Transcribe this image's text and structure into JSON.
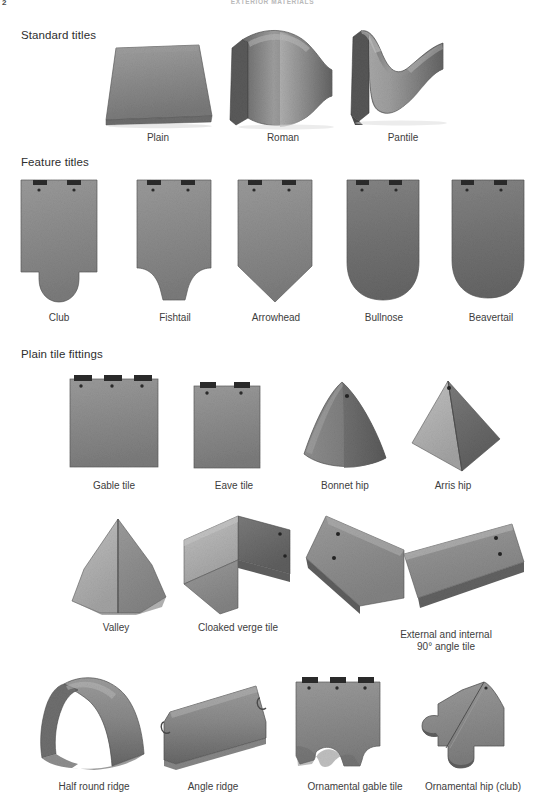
{
  "page": {
    "folio": "2",
    "running_head": "Exterior materials",
    "background": "#ffffff",
    "text_color": "#3a3a3a"
  },
  "palette": {
    "tile_light": "#b4b4b4",
    "tile_mid": "#8f8f8f",
    "tile_dark": "#6e6e6e",
    "tile_darkest": "#4f4f4f",
    "tile_edge": "#3c3c3c",
    "nib_dark": "#2f2f2f",
    "shadow": "#c9c9c9"
  },
  "sections": [
    {
      "id": "standard-tiles",
      "heading": "Standard titles",
      "items": [
        {
          "id": "plain",
          "caption": "Plain",
          "shape": "flat-slab"
        },
        {
          "id": "roman",
          "caption": "Roman",
          "shape": "barrel-roll"
        },
        {
          "id": "pantile",
          "caption": "Pantile",
          "shape": "s-wave"
        }
      ]
    },
    {
      "id": "feature-tiles",
      "heading": "Feature titles",
      "items": [
        {
          "id": "club",
          "caption": "Club",
          "shape": "club-bottom"
        },
        {
          "id": "fishtail",
          "caption": "Fishtail",
          "shape": "fishtail-bottom"
        },
        {
          "id": "arrowhead",
          "caption": "Arrowhead",
          "shape": "pointed-bottom"
        },
        {
          "id": "bullnose",
          "caption": "Bullnose",
          "shape": "round-bottom"
        },
        {
          "id": "beavertail",
          "caption": "Beavertail",
          "shape": "beavertail-bottom"
        }
      ]
    },
    {
      "id": "plain-tile-fittings",
      "heading": "Plain tile fittings",
      "rows": [
        {
          "id": "fittings-row-1",
          "items": [
            {
              "id": "gable-tile",
              "caption": "Gable tile",
              "shape": "wide-rect-nibs"
            },
            {
              "id": "eave-tile",
              "caption": "Eave tile",
              "shape": "narrow-rect-nibs"
            },
            {
              "id": "bonnet-hip",
              "caption": "Bonnet hip",
              "shape": "cone"
            },
            {
              "id": "arris-hip",
              "caption": "Arris hip",
              "shape": "pyramid"
            }
          ]
        },
        {
          "id": "fittings-row-2",
          "items": [
            {
              "id": "valley",
              "caption": "Valley",
              "shape": "faceted-cone"
            },
            {
              "id": "cloaked-verge-tile",
              "caption": "Cloaked verge tile",
              "shape": "l-angle"
            },
            {
              "id": "angle-tile",
              "caption": "External and internal\n90° angle tile",
              "shape": "double-angle"
            }
          ]
        },
        {
          "id": "fittings-row-3",
          "items": [
            {
              "id": "half-round-ridge",
              "caption": "Half round ridge",
              "shape": "half-round-ridge"
            },
            {
              "id": "angle-ridge",
              "caption": "Angle ridge",
              "shape": "angle-ridge"
            },
            {
              "id": "ornamental-gable",
              "caption": "Ornamental gable tile",
              "shape": "scalloped-slab"
            },
            {
              "id": "ornamental-hip-club",
              "caption": "Ornamental hip (club)",
              "shape": "club-hip-profile"
            }
          ]
        }
      ]
    }
  ]
}
